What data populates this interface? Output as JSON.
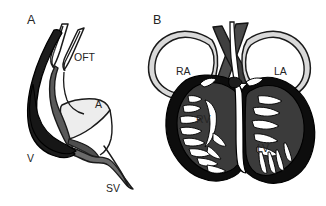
{
  "figure": {
    "background_color": "#ffffff",
    "width": 326,
    "height": 206,
    "type": "scientific-diagram"
  },
  "panels": [
    {
      "letter": "A",
      "name": "embryonic-heart-tube",
      "labels": [
        {
          "id": "oft",
          "text": "OFT",
          "x": 74,
          "y": 61,
          "meaning": "outflow tract"
        },
        {
          "id": "a",
          "text": "A",
          "x": 95,
          "y": 108,
          "meaning": "atrium"
        },
        {
          "id": "v",
          "text": "V",
          "x": 27,
          "y": 162,
          "meaning": "ventricle"
        },
        {
          "id": "sv",
          "text": "SV",
          "x": 106,
          "y": 192,
          "meaning": "sinus venosus"
        }
      ],
      "letter_pos": {
        "x": 27,
        "y": 24
      }
    },
    {
      "letter": "B",
      "name": "four-chambered-heart",
      "labels": [
        {
          "id": "ra",
          "text": "RA",
          "x": 176,
          "y": 75,
          "meaning": "right atrium"
        },
        {
          "id": "la",
          "text": "LA",
          "x": 274,
          "y": 75,
          "meaning": "left atrium"
        },
        {
          "id": "rv",
          "text": "RV",
          "x": 196,
          "y": 123,
          "meaning": "right ventricle"
        },
        {
          "id": "lv",
          "text": "LV",
          "x": 257,
          "y": 152,
          "meaning": "left ventricle"
        }
      ],
      "letter_pos": {
        "x": 153,
        "y": 24
      }
    }
  ],
  "colors": {
    "outline": "#1a1a1a",
    "myocardium_dark": "#121212",
    "chamber_mid_gray": "#3d3d3d",
    "vessel_gray": "#555555",
    "wall_light_gray": "#d8d8d8",
    "lumen_white": "#ffffff",
    "atrium_pale": "#eeeeee",
    "label_text": "#252525"
  }
}
